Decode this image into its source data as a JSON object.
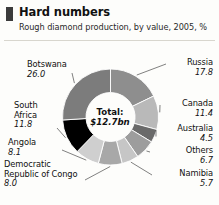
{
  "header": {
    "marker": "header-marker",
    "title": "Hard numbers",
    "subtitle": "Rough diamond production, by value, 2005, %"
  },
  "center": {
    "total_label": "Total:",
    "total_value": "$12.7bn"
  },
  "chart_data": {
    "type": "pie",
    "variant": "donut",
    "title": "Hard numbers",
    "subtitle": "Rough diamond production, by value, 2005, %",
    "unit": "%",
    "total_label": "Total:",
    "total_value": "$12.7bn",
    "start_angle_deg": 0,
    "direction": "clockwise",
    "inner_radius_ratio": 0.5,
    "legend": "callout-labels",
    "categories": [
      "Russia",
      "Canada",
      "Australia",
      "Others",
      "Namibia",
      "Democratic Republic of Congo",
      "Angola",
      "South Africa",
      "Botswana"
    ],
    "values": [
      17.8,
      11.4,
      4.5,
      6.7,
      5.7,
      8.0,
      8.1,
      11.8,
      26.0
    ],
    "colors": [
      "#8e8e8e",
      "#b9b9b9",
      "#6a6a6a",
      "#9d9d9d",
      "#c6c6c6",
      "#a8a8a8",
      "#cfcfcf",
      "#000000",
      "#7c7c7c"
    ],
    "slices": [
      {
        "label": "Russia",
        "value": 17.8,
        "color": "#8e8e8e",
        "side": "right"
      },
      {
        "label": "Canada",
        "value": 11.4,
        "color": "#b9b9b9",
        "side": "right"
      },
      {
        "label": "Australia",
        "value": 4.5,
        "color": "#6a6a6a",
        "side": "right"
      },
      {
        "label": "Others",
        "value": 6.7,
        "color": "#9d9d9d",
        "side": "right"
      },
      {
        "label": "Namibia",
        "value": 5.7,
        "color": "#c6c6c6",
        "side": "right"
      },
      {
        "label": "Democratic Republic of Congo",
        "value": 8.0,
        "color": "#a8a8a8",
        "side": "left"
      },
      {
        "label": "Angola",
        "value": 8.1,
        "color": "#cfcfcf",
        "side": "left"
      },
      {
        "label": "South Africa",
        "value": 11.8,
        "color": "#000000",
        "side": "left"
      },
      {
        "label": "Botswana",
        "value": 26.0,
        "color": "#7c7c7c",
        "side": "left"
      }
    ]
  },
  "labels": {
    "botswana": {
      "name": "Botswana",
      "value": "26.0"
    },
    "south_africa": {
      "name": "South",
      "name2": "Africa",
      "value": "11.8"
    },
    "angola": {
      "name": "Angola",
      "value": "8.1"
    },
    "drc": {
      "name": "Democratic",
      "name2": "Republic of Congo",
      "value": "8.0"
    },
    "russia": {
      "name": "Russia",
      "value": "17.8"
    },
    "canada": {
      "name": "Canada",
      "value": "11.4"
    },
    "australia": {
      "name": "Australia",
      "value": "4.5"
    },
    "others": {
      "name": "Others",
      "value": "6.7"
    },
    "namibia": {
      "name": "Namibia",
      "value": "5.7"
    }
  }
}
